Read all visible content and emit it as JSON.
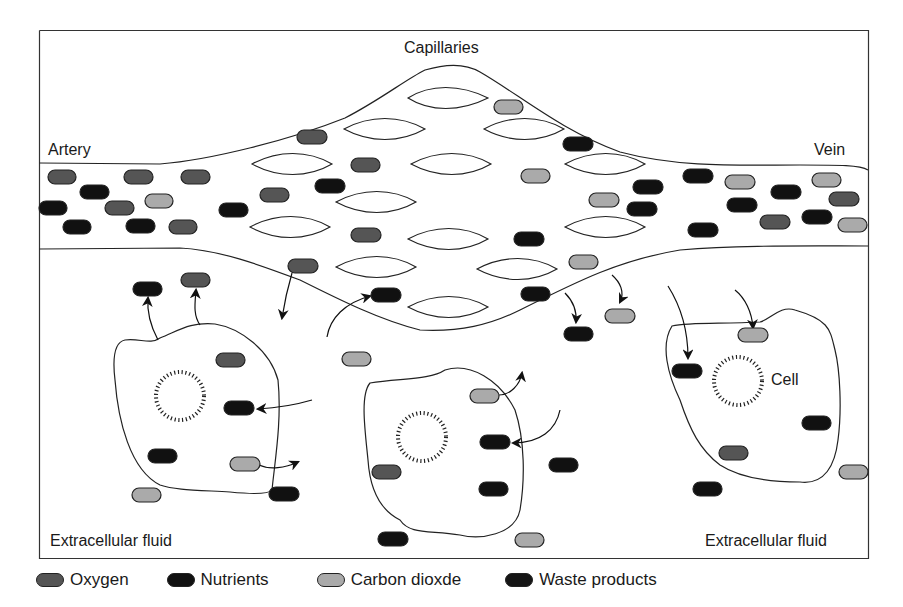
{
  "labels": {
    "capillaries": "Capillaries",
    "artery": "Artery",
    "vein": "Vein",
    "cell": "Cell",
    "extracellular_left": "Extracellular fluid",
    "extracellular_right": "Extracellular fluid"
  },
  "colors": {
    "oxygen": "#555555",
    "nutrients": "#111111",
    "carbon_dioxide": "#aaaaaa",
    "waste_products": "#151515",
    "outline": "#222222"
  },
  "legend": [
    {
      "label": "Oxygen",
      "color": "#555555"
    },
    {
      "label": "Nutrients",
      "color": "#111111"
    },
    {
      "label": "Carbon dioxde",
      "color": "#aaaaaa"
    },
    {
      "label": "Waste products",
      "color": "#151515"
    }
  ]
}
